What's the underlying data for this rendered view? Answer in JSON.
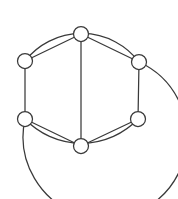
{
  "figure": {
    "kind": "graph-diagram",
    "title": "",
    "width": 178,
    "height": 199,
    "background_color": "#ffffff",
    "stroke_color": "#3a3a3a",
    "node_fill_color": "#ffffff",
    "stroke_width": 1.25,
    "node_radius": 7.5
  },
  "chart_data": {
    "type": "diagram",
    "title": "",
    "node_count": 7,
    "edge_count": 11,
    "nodes": [
      {
        "id": "n-top",
        "label": "",
        "x": 81,
        "y": 34
      },
      {
        "id": "n-upper-left",
        "label": "",
        "x": 25,
        "y": 61
      },
      {
        "id": "n-upper-right",
        "label": "",
        "x": 139,
        "y": 62
      },
      {
        "id": "n-lower-left",
        "label": "",
        "x": 25,
        "y": 119
      },
      {
        "id": "n-lower-right",
        "label": "",
        "x": 138,
        "y": 119
      },
      {
        "id": "n-bottom",
        "label": "",
        "x": 81,
        "y": 146
      }
    ],
    "edges": [
      {
        "id": "e-top-upperleft",
        "from": "n-top",
        "to": "n-upper-left",
        "shape": "line"
      },
      {
        "id": "e-top-upperright",
        "from": "n-top",
        "to": "n-upper-right",
        "shape": "line"
      },
      {
        "id": "e-top-bottom",
        "from": "n-top",
        "to": "n-bottom",
        "shape": "line"
      },
      {
        "id": "e-upperleft-lowerleft",
        "from": "n-upper-left",
        "to": "n-lower-left",
        "shape": "line"
      },
      {
        "id": "e-upperright-lowerright",
        "from": "n-upper-right",
        "to": "n-lower-right",
        "shape": "line"
      },
      {
        "id": "e-lowerleft-bottom",
        "from": "n-lower-left",
        "to": "n-bottom",
        "shape": "line"
      },
      {
        "id": "e-lowerright-bottom",
        "from": "n-lower-right",
        "to": "n-bottom",
        "shape": "line"
      },
      {
        "id": "e-upperleft-upperright",
        "from": "n-upper-left",
        "to": "n-upper-right",
        "shape": "arc-over-top"
      },
      {
        "id": "e-lowerleft-lowerright",
        "from": "n-lower-left",
        "to": "n-lower-right",
        "shape": "arc-under-bottom"
      },
      {
        "id": "e-upperright-lowerleft",
        "from": "n-upper-right",
        "to": "n-lower-left",
        "shape": "arc-around-right"
      }
    ]
  },
  "geometry": {
    "edge_top_upperleft": "M 81 34 L 25 61",
    "edge_top_upperright": "M 81 34 L 139 62",
    "edge_top_bottom": "M 81 34 L 81 146",
    "edge_upperleft_lowerleft": "M 25 61 L 25 119",
    "edge_upperright_lowerright": "M 139 62 L 138 119",
    "edge_lowerleft_bottom": "M 25 119 L 81 146",
    "edge_lowerright_bottom": "M 138 119 L 81 146",
    "arc_top": "M 25 61 A 72 72 0 0 1 139 62",
    "arc_bottom_inner": "M 25 119 A 78 78 0 0 0 138 119",
    "arc_outer_right": "M 139 62 A 82 82 0 1 1 25 119"
  }
}
